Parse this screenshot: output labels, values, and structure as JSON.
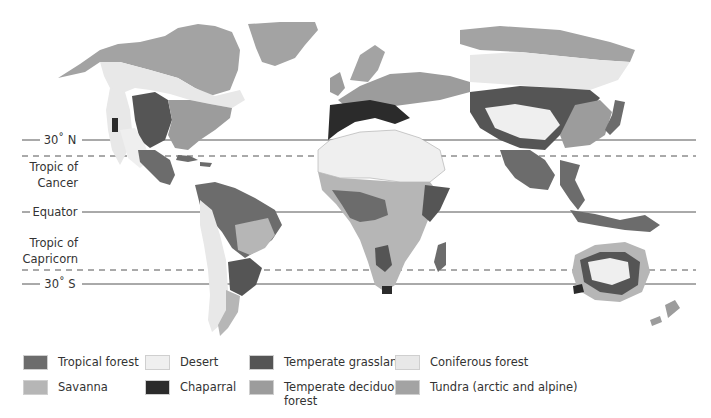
{
  "colors": {
    "tropical_forest": "#6c6c6c",
    "savanna": "#b6b6b6",
    "desert": "#efefef",
    "chaparral": "#2b2b2b",
    "temperate_grassland": "#555555",
    "temperate_deciduous_forest": "#9c9c9c",
    "coniferous_forest": "#e8e8e8",
    "tundra": "#a3a3a3",
    "line": "#555555"
  },
  "latitude_lines": [
    {
      "id": "n30",
      "label": "30° N",
      "y": 140,
      "style": "solid"
    },
    {
      "id": "cancer",
      "label": "Tropic of Cancer",
      "y": 156,
      "style": "dashed"
    },
    {
      "id": "equator",
      "label": "Equator",
      "y": 212,
      "style": "solid"
    },
    {
      "id": "capricorn",
      "label": "Tropic of Capricorn",
      "y": 270,
      "style": "dashed"
    },
    {
      "id": "s30",
      "label": "30° S",
      "y": 284,
      "style": "solid"
    }
  ],
  "labels": {
    "n30": "30˚ N",
    "cancer_1": "Tropic of",
    "cancer_2": "Cancer",
    "equator": "Equator",
    "capricorn_1": "Tropic of",
    "capricorn_2": "Capricorn",
    "s30": "30˚ S"
  },
  "legend": {
    "items": [
      {
        "label": "Tropical forest",
        "color": "#6c6c6c"
      },
      {
        "label": "Savanna",
        "color": "#b6b6b6"
      },
      {
        "label": "Desert",
        "color": "#efefef"
      },
      {
        "label": "Chaparral",
        "color": "#2b2b2b"
      },
      {
        "label": "Temperate grassland",
        "color": "#555555"
      },
      {
        "label": "Temperate deciduous forest",
        "color": "#9c9c9c"
      },
      {
        "label": "Coniferous forest",
        "color": "#e8e8e8"
      },
      {
        "label": "Tundra (arctic and alpine)",
        "color": "#a3a3a3"
      }
    ],
    "tropical_forest": "Tropical forest",
    "savanna": "Savanna",
    "desert": "Desert",
    "chaparral": "Chaparral",
    "temperate_grassland": "Temperate grassland",
    "temperate_deciduous_1": "Temperate deciduous",
    "temperate_deciduous_2": "forest",
    "coniferous_forest": "Coniferous forest",
    "tundra": "Tundra (arctic and alpine)"
  }
}
